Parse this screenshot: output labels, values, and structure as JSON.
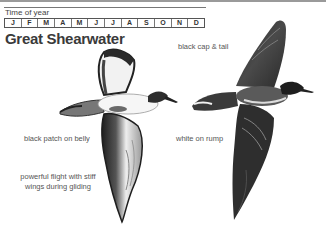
{
  "header": {
    "section_label": "Time of year",
    "months": [
      "J",
      "F",
      "M",
      "A",
      "M",
      "J",
      "J",
      "A",
      "S",
      "O",
      "N",
      "D"
    ]
  },
  "species": {
    "name": "Great Shearwater"
  },
  "annotations": {
    "cap_tail": "black cap & tail",
    "belly": "black patch on belly",
    "rump": "white on rump",
    "flight_line1": "powerful flight with stiff",
    "flight_line2": "wings during gliding"
  },
  "illustrations": [
    {
      "name": "underside-view",
      "icon": "shearwater-underside-icon"
    },
    {
      "name": "upperside-view",
      "icon": "shearwater-upperside-icon"
    }
  ],
  "colors": {
    "dark_plumage": "#2a2a2a",
    "mid_plumage": "#6a6a6a",
    "text": "#555555"
  }
}
